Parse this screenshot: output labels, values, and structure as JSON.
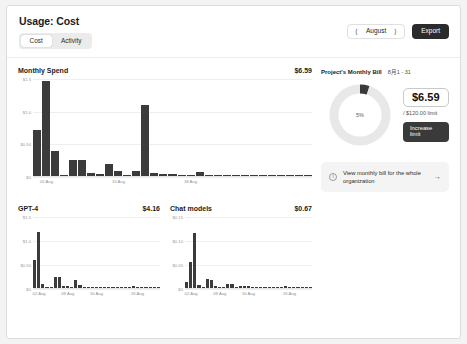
{
  "header": {
    "title": "Usage: Cost",
    "tabs": [
      {
        "label": "Cost",
        "active": true
      },
      {
        "label": "Activity",
        "active": false
      }
    ],
    "month_prev_icon": "chevron-left-icon",
    "month_label": "August",
    "month_next_icon": "chevron-right-icon",
    "export_label": "Export"
  },
  "bill": {
    "title": "Project's Monthly Bill",
    "range": "8月1 - 31",
    "percent_label": "5%",
    "percent_value": 5,
    "amount": "$6.59",
    "limit_text": "/ $120.00 limit",
    "increase_label": "Increase limit",
    "banner_icon": "info-icon",
    "banner_text": "View monthly bill for the whole organization",
    "banner_arrow": "arrow-right-icon"
  },
  "chart_data": [
    {
      "type": "bar",
      "id": "monthly-spend",
      "title": "Monthly Spend",
      "total": "$6.59",
      "xlabel": "",
      "ylabel": "",
      "ylim": [
        0,
        1.5
      ],
      "yticks": [
        0,
        0.5,
        1.0,
        1.5
      ],
      "ytick_labels": [
        "$0",
        "$0.50",
        "$1.0",
        "$1.5"
      ],
      "grid": true,
      "categories": [
        "01 Aug",
        "02 Aug",
        "03 Aug",
        "04 Aug",
        "05 Aug",
        "06 Aug",
        "07 Aug",
        "08 Aug",
        "09 Aug",
        "10 Aug",
        "11 Aug",
        "12 Aug",
        "13 Aug",
        "14 Aug",
        "15 Aug",
        "16 Aug",
        "17 Aug",
        "18 Aug",
        "19 Aug",
        "20 Aug",
        "21 Aug",
        "22 Aug",
        "23 Aug",
        "24 Aug",
        "25 Aug",
        "26 Aug",
        "27 Aug",
        "28 Aug",
        "29 Aug",
        "30 Aug",
        "31 Aug"
      ],
      "tick_labels": [
        {
          "label": "02 Aug",
          "index": 1
        },
        {
          "label": "10 Aug",
          "index": 9
        },
        {
          "label": "18 Aug",
          "index": 17
        }
      ],
      "values": [
        0.71,
        1.46,
        0.39,
        0.02,
        0.24,
        0.24,
        0.05,
        0.03,
        0.19,
        0.08,
        0.02,
        0.07,
        1.09,
        0.04,
        0.03,
        0.03,
        0.02,
        0.01,
        0.06,
        0.01
      ]
    },
    {
      "type": "bar",
      "id": "gpt-4",
      "title": "GPT-4",
      "total": "$4.16",
      "xlabel": "",
      "ylabel": "",
      "ylim": [
        0,
        1.5
      ],
      "yticks": [
        0,
        0.5,
        1.0,
        1.5
      ],
      "ytick_labels": [
        "$0",
        "$0.50",
        "$1.0",
        "$1.5"
      ],
      "grid": true,
      "tick_labels": [
        {
          "label": "02 Aug",
          "index": 1
        },
        {
          "label": "09 Aug",
          "index": 8
        },
        {
          "label": "16 Aug",
          "index": 15
        },
        {
          "label": "26 Aug",
          "index": 25
        }
      ],
      "values": [
        0.58,
        1.16,
        0.08,
        0.0,
        0.0,
        0.22,
        0.22,
        0.05,
        0.04,
        0.0,
        0.16,
        0.07,
        0.0,
        0.0,
        0.03,
        0.02,
        0.0,
        0.0,
        0.0,
        0.0,
        0.0,
        0.0,
        0.0,
        0.0,
        0.05,
        0.0,
        0.0,
        0.0,
        0.0,
        0.0,
        0.0
      ]
    },
    {
      "type": "bar",
      "id": "chat-models",
      "title": "Chat models",
      "total": "$0.67",
      "xlabel": "",
      "ylabel": "",
      "ylim": [
        0,
        0.15
      ],
      "yticks": [
        0,
        0.05,
        0.1,
        0.15
      ],
      "ytick_labels": [
        "$0",
        "$0.05",
        "$0.10",
        "$0.15"
      ],
      "grid": true,
      "tick_labels": [
        {
          "label": "02 Aug",
          "index": 1
        },
        {
          "label": "09 Aug",
          "index": 8
        },
        {
          "label": "16 Aug",
          "index": 15
        },
        {
          "label": "26 Aug",
          "index": 25
        }
      ],
      "values": [
        0.012,
        0.055,
        0.115,
        0.006,
        0.0,
        0.018,
        0.016,
        0.004,
        0.003,
        0.0,
        0.008,
        0.008,
        0.0,
        0.005,
        0.005,
        0.004,
        0.0,
        0.003,
        0.0,
        0.0,
        0.0,
        0.0,
        0.0,
        0.0,
        0.004,
        0.0,
        0.0,
        0.0,
        0.0,
        0.0,
        0.0
      ]
    }
  ]
}
